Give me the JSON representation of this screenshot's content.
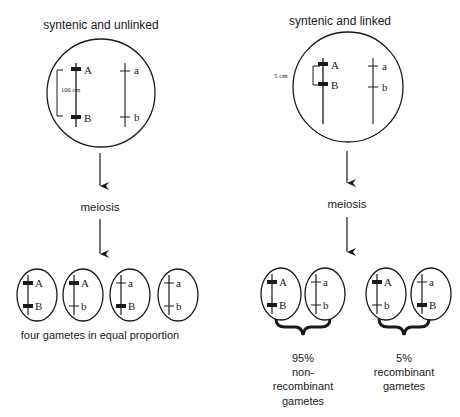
{
  "left_panel": {
    "title": "syntenic and unlinked",
    "distance_label": "100 cm",
    "chromosome_1": {
      "gene_top": "A",
      "gene_bottom": "B",
      "allele_style": "dominant"
    },
    "chromosome_2": {
      "gene_top": "a",
      "gene_bottom": "b",
      "allele_style": "recessive"
    },
    "process_label": "meiosis",
    "gametes": [
      {
        "top": "A",
        "bottom": "B"
      },
      {
        "top": "A",
        "bottom": "b"
      },
      {
        "top": "a",
        "bottom": "B"
      },
      {
        "top": "a",
        "bottom": "b"
      }
    ],
    "caption": "four gametes in equal proportion"
  },
  "right_panel": {
    "title": "syntenic and linked",
    "distance_label": "5 cm",
    "chromosome_1": {
      "gene_top": "A",
      "gene_bottom": "B",
      "allele_style": "dominant"
    },
    "chromosome_2": {
      "gene_top": "a",
      "gene_bottom": "b",
      "allele_style": "recessive"
    },
    "process_label": "meiosis",
    "gametes": [
      {
        "top": "A",
        "bottom": "B"
      },
      {
        "top": "a",
        "bottom": "b"
      },
      {
        "top": "A",
        "bottom": "b"
      },
      {
        "top": "a",
        "bottom": "B"
      }
    ],
    "groups": [
      {
        "percent": "95%",
        "line1": "non-",
        "line2": "recombinant",
        "line3": "gametes"
      },
      {
        "percent": "5%",
        "line1": "recombinant",
        "line2": "gametes"
      }
    ]
  }
}
